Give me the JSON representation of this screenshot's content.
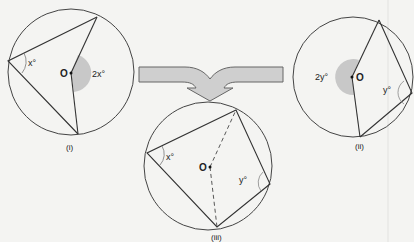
{
  "colors": {
    "background": "#f4f4f2",
    "stroke": "#333333",
    "shaded_angle": "#c8c8c8",
    "arrow_fill": "#cfcfcf",
    "arrow_stroke": "#666666"
  },
  "figures": [
    {
      "id": "i",
      "caption": "(i)",
      "center_label": "O",
      "inscribed_angle_label": "x°",
      "central_angle_label": "2x°"
    },
    {
      "id": "ii",
      "caption": "(ii)",
      "center_label": "O",
      "inscribed_angle_label": "y°",
      "central_angle_label": "2y°"
    },
    {
      "id": "iii",
      "caption": "(iii)",
      "center_label": "O",
      "angle_labels": [
        "x°",
        "y°"
      ]
    }
  ],
  "arrow": {
    "description": "merge arrow combining (i) and (ii) into (iii)"
  }
}
